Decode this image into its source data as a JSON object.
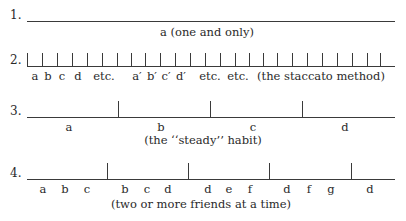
{
  "diagram": {
    "rows": [
      {
        "number": "1.",
        "line": {
          "x1": 27,
          "x2": 395,
          "y": 21
        },
        "ticks": [],
        "tick_top": 21,
        "labels": [],
        "caption": "a   (one and only)",
        "caption_x": 207,
        "caption_y": 25
      },
      {
        "number": "2.",
        "line": {
          "x1": 27,
          "x2": 395,
          "y": 66
        },
        "ticks": [
          27,
          42,
          57,
          72,
          87,
          102,
          117,
          131,
          145,
          160,
          175,
          190,
          205,
          220,
          235,
          249,
          263,
          277,
          292,
          307,
          322,
          337,
          352,
          367,
          380
        ],
        "tick_top": 53,
        "labels": [
          {
            "text": "a",
            "x": 35
          },
          {
            "text": "b",
            "x": 48
          },
          {
            "text": "c",
            "x": 62
          },
          {
            "text": "d",
            "x": 78
          },
          {
            "text": "etc.",
            "x": 104
          },
          {
            "text": "a′",
            "x": 137
          },
          {
            "text": "b′",
            "x": 152
          },
          {
            "text": "c′",
            "x": 166
          },
          {
            "text": "d′",
            "x": 181
          },
          {
            "text": "etc.",
            "x": 210
          },
          {
            "text": "etc.",
            "x": 238
          },
          {
            "text": "(the staccato method)",
            "x": 321
          }
        ],
        "labels_y": 69,
        "caption": "",
        "caption_x": 0,
        "caption_y": 0
      },
      {
        "number": "3.",
        "line": {
          "x1": 27,
          "x2": 395,
          "y": 117
        },
        "ticks": [
          118,
          210,
          302
        ],
        "tick_top": 101,
        "labels": [
          {
            "text": "a",
            "x": 69
          },
          {
            "text": "b",
            "x": 161
          },
          {
            "text": "c",
            "x": 253
          },
          {
            "text": "d",
            "x": 345
          }
        ],
        "labels_y": 120,
        "caption": "(the ‘‘steady’’ habit)",
        "caption_x": 203,
        "caption_y": 133
      },
      {
        "number": "4.",
        "line": {
          "x1": 27,
          "x2": 395,
          "y": 179
        },
        "ticks": [
          107,
          188,
          269,
          351
        ],
        "tick_top": 163,
        "labels": [
          {
            "text": "a",
            "x": 43
          },
          {
            "text": "b",
            "x": 65
          },
          {
            "text": "c",
            "x": 87
          },
          {
            "text": "b",
            "x": 125
          },
          {
            "text": "c",
            "x": 147
          },
          {
            "text": "d",
            "x": 168
          },
          {
            "text": "d",
            "x": 208
          },
          {
            "text": "e",
            "x": 229
          },
          {
            "text": "f",
            "x": 250
          },
          {
            "text": "d",
            "x": 287
          },
          {
            "text": "f",
            "x": 309
          },
          {
            "text": "g",
            "x": 331
          },
          {
            "text": "d",
            "x": 370
          }
        ],
        "labels_y": 182,
        "caption": "(two or more friends at a time)",
        "caption_x": 201,
        "caption_y": 197
      }
    ]
  }
}
